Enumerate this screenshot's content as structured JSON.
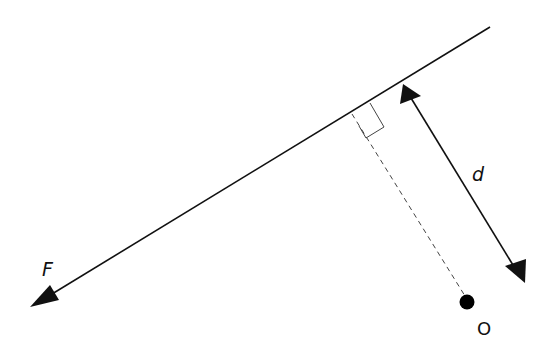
{
  "diagram": {
    "labels": {
      "force": "F",
      "distance": "d",
      "point": "O"
    },
    "colors": {
      "line": "#111111",
      "background": "#ffffff"
    },
    "elements": [
      {
        "type": "line-of-action",
        "from": [
          490,
          27
        ],
        "to": [
          32,
          306
        ],
        "arrow_end": "F"
      },
      {
        "type": "perpendicular",
        "from": [
          352,
          113
        ],
        "to": [
          466,
          300
        ],
        "style": "dashed"
      },
      {
        "type": "right-angle-marker",
        "at": [
          352,
          113
        ]
      },
      {
        "type": "dimension-arrow",
        "from": [
          404,
          85
        ],
        "to": [
          524,
          282
        ],
        "label": "d"
      },
      {
        "type": "point",
        "at": [
          467,
          302
        ],
        "label": "O"
      }
    ]
  }
}
